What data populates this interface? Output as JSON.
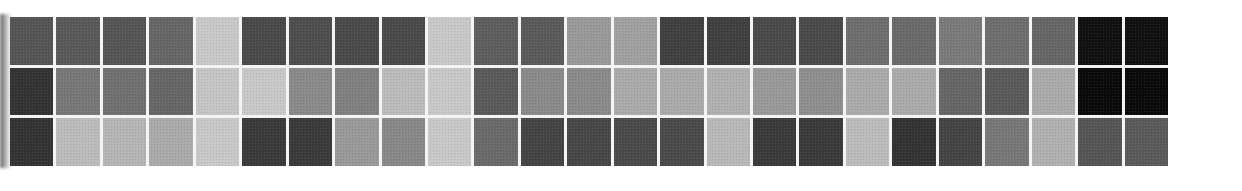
{
  "figure": {
    "rows": 3,
    "columns": 25,
    "style": "grayscale heatmap grid (scanned)",
    "grid_gap_color": "#f4f4f4",
    "background": "#ffffff"
  },
  "chart_data": {
    "type": "heatmap",
    "title": "",
    "xlabel": "",
    "ylabel": "",
    "x_categories": [],
    "y_categories": [],
    "legend": "none",
    "grid": true,
    "value_scale": "grayscale darkness 0 (white) to 1 (black)",
    "colors": [
      [
        "#555555",
        "#595959",
        "#555555",
        "#666666",
        "#c8c8c8",
        "#4a4a4a",
        "#4e4e4e",
        "#4a4a4a",
        "#4a4a4a",
        "#c8c8c8",
        "#5e5e5e",
        "#5a5a5a",
        "#999999",
        "#a0a0a0",
        "#404040",
        "#404040",
        "#4a4a4a",
        "#4a4a4a",
        "#6e6e6e",
        "#6a6a6a",
        "#7a7a7a",
        "#6e6e6e",
        "#666666",
        "#111111",
        "#111111"
      ],
      [
        "#333333",
        "#777777",
        "#707070",
        "#666666",
        "#c5c5c5",
        "#c8c8c8",
        "#8a8a8a",
        "#808080",
        "#bbbbbb",
        "#c8c8c8",
        "#5a5a5a",
        "#8a8a8a",
        "#8a8a8a",
        "#aaaaaa",
        "#aaaaaa",
        "#b0b0b0",
        "#999999",
        "#8e8e8e",
        "#aaaaaa",
        "#aaaaaa",
        "#666666",
        "#5a5a5a",
        "#aaaaaa",
        "#0a0a0a",
        "#0a0a0a"
      ],
      [
        "#333333",
        "#bbbbbb",
        "#b5b5b5",
        "#aaaaaa",
        "#c8c8c8",
        "#3a3a3a",
        "#3a3a3a",
        "#999999",
        "#888888",
        "#c8c8c8",
        "#6a6a6a",
        "#444444",
        "#474747",
        "#4a4a4a",
        "#4a4a4a",
        "#b8b8b8",
        "#3a3a3a",
        "#3a3a3a",
        "#bbbbbb",
        "#333333",
        "#444444",
        "#777777",
        "#b0b0b0",
        "#555555",
        "#5a5a5a"
      ]
    ],
    "values": [
      [
        0.67,
        0.65,
        0.67,
        0.6,
        0.22,
        0.71,
        0.69,
        0.71,
        0.71,
        0.22,
        0.63,
        0.65,
        0.4,
        0.37,
        0.75,
        0.75,
        0.71,
        0.71,
        0.57,
        0.58,
        0.52,
        0.57,
        0.6,
        0.93,
        0.93
      ],
      [
        0.8,
        0.53,
        0.56,
        0.6,
        0.23,
        0.22,
        0.46,
        0.5,
        0.27,
        0.22,
        0.65,
        0.46,
        0.46,
        0.33,
        0.33,
        0.31,
        0.4,
        0.44,
        0.33,
        0.33,
        0.6,
        0.65,
        0.33,
        0.96,
        0.96
      ],
      [
        0.8,
        0.27,
        0.29,
        0.33,
        0.22,
        0.77,
        0.77,
        0.4,
        0.47,
        0.22,
        0.58,
        0.73,
        0.72,
        0.71,
        0.71,
        0.28,
        0.77,
        0.77,
        0.27,
        0.8,
        0.73,
        0.53,
        0.31,
        0.67,
        0.65
      ]
    ]
  }
}
